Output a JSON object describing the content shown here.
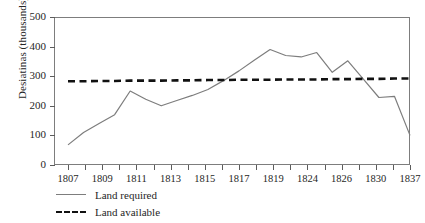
{
  "chart_data": {
    "type": "line",
    "title": "",
    "xlabel": "",
    "ylabel": "Desiatinas (thousands)",
    "ylim": [
      0,
      500
    ],
    "yticks": [
      0,
      100,
      200,
      300,
      400,
      500
    ],
    "grid": false,
    "legend_position": "below-left",
    "x": [
      "1807",
      "1808",
      "1809",
      "1810",
      "1811",
      "1812",
      "1813",
      "1814",
      "1815",
      "1816",
      "1817",
      "1818",
      "1819",
      "1820",
      "1821",
      "1822",
      "1824",
      "1825",
      "1826",
      "1828",
      "1830",
      "1832",
      "1837"
    ],
    "xtick_labels": [
      "1807",
      "1809",
      "1811",
      "1813",
      "1815",
      "1817",
      "1819",
      "1824",
      "1826",
      "1830",
      "1837"
    ],
    "xtick_count": 21,
    "series": [
      {
        "name": "Land required",
        "style": "solid",
        "color": "#7d7d7d",
        "values": [
          68,
          110,
          140,
          170,
          250,
          222,
          200,
          218,
          235,
          255,
          285,
          318,
          355,
          390,
          370,
          365,
          380,
          313,
          352,
          290,
          228,
          232,
          100
        ]
      },
      {
        "name": "Land available",
        "style": "dashed",
        "color": "#111111",
        "values": [
          283,
          283,
          284,
          284,
          285,
          285,
          285,
          286,
          286,
          287,
          287,
          288,
          288,
          288,
          289,
          289,
          289,
          290,
          290,
          291,
          291,
          292,
          292
        ]
      }
    ],
    "legend": [
      "Land required",
      "Land available"
    ]
  },
  "axis": {
    "y_label": "Desiatinas (thousands)",
    "y_ticks": [
      "0",
      "100",
      "200",
      "300",
      "400",
      "500"
    ],
    "x_ticks": [
      "1807",
      "1809",
      "1811",
      "1813",
      "1815",
      "1817",
      "1819",
      "1824",
      "1826",
      "1830",
      "1837"
    ]
  },
  "legend": {
    "required_label": "Land required",
    "available_label": "Land available"
  },
  "colors": {
    "required_line": "#7d7d7d",
    "available_line": "#111111",
    "frame": "#7d7d7d",
    "text": "#262626"
  }
}
